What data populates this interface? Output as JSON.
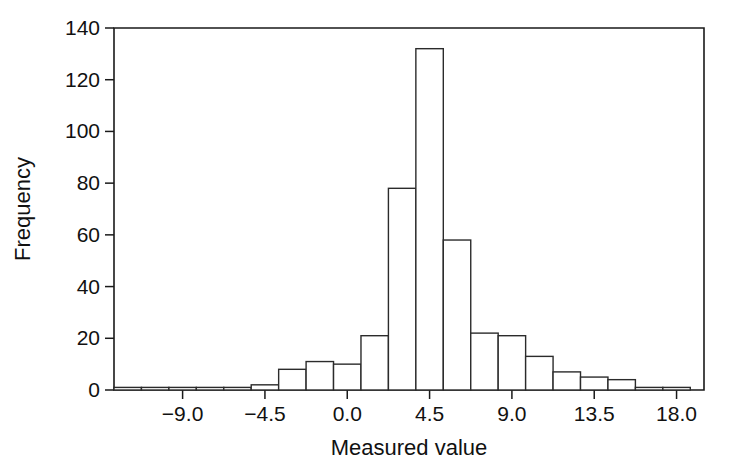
{
  "chart_data": {
    "type": "bar",
    "title": "",
    "subtitle": "",
    "xlabel": "Measured value",
    "ylabel": "Frequency",
    "xlim": [
      -12.75,
      19.5
    ],
    "ylim": [
      0,
      140
    ],
    "grid": false,
    "legend": "none",
    "x_ticks": [
      "-9.0",
      "-4.5",
      "0.0",
      "4.5",
      "9.0",
      "13.5",
      "18.0"
    ],
    "x_tick_values": [
      -9.0,
      -4.5,
      0.0,
      4.5,
      9.0,
      13.5,
      18.0
    ],
    "y_ticks": [
      "0",
      "20",
      "40",
      "60",
      "80",
      "100",
      "120",
      "140"
    ],
    "y_tick_values": [
      0,
      20,
      40,
      60,
      80,
      100,
      120,
      140
    ],
    "bin_width": 1.5,
    "bin_starts": [
      -12.75,
      -11.25,
      -9.75,
      -8.25,
      -6.75,
      -5.25,
      -3.75,
      -2.25,
      -0.75,
      0.75,
      2.25,
      3.75,
      5.25,
      6.75,
      8.25,
      9.75,
      11.25,
      12.75,
      14.25,
      15.75,
      17.25
    ],
    "categories": [
      "-12.75",
      "-11.25",
      "-9.75",
      "-8.25",
      "-6.75",
      "-5.25",
      "-3.75",
      "-2.25",
      "-0.75",
      "0.75",
      "2.25",
      "3.75",
      "5.25",
      "6.75",
      "8.25",
      "9.75",
      "11.25",
      "12.75",
      "14.25",
      "15.75",
      "17.25"
    ],
    "values": [
      1,
      1,
      1,
      1,
      1,
      2,
      8,
      11,
      10,
      21,
      78,
      132,
      58,
      22,
      21,
      13,
      7,
      5,
      4,
      1,
      1
    ],
    "colors": {
      "bar_fill": "#ffffff",
      "bar_stroke": "#2b2b2b",
      "axis": "#1a1a1a",
      "text": "#111111",
      "background": "#ffffff"
    }
  },
  "axes": {
    "x_axis_label": "Measured value",
    "y_axis_label": "Frequency"
  }
}
